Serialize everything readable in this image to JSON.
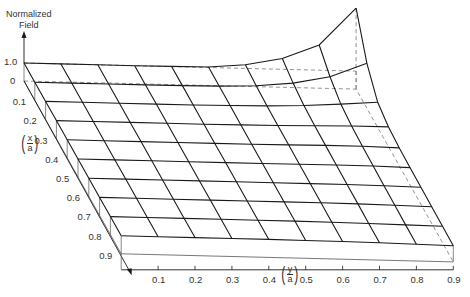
{
  "chart_data": {
    "type": "surface3d",
    "title": "",
    "zlabel": "Normalized Field",
    "xlabel": "(x/a)",
    "ylabel": "(y/a)",
    "z_ticks": [
      "1.0",
      "0"
    ],
    "x_ticks": [
      "0.1",
      "0.2",
      "0.3",
      "0.4",
      "0.5",
      "0.6",
      "0.7",
      "0.8",
      "0.9"
    ],
    "y_ticks": [
      "0.1",
      "0.2",
      "0.3",
      "0.4",
      "0.5",
      "0.6",
      "0.7",
      "0.8",
      "0.9"
    ],
    "x_grid": [
      0,
      0.1,
      0.2,
      0.3,
      0.4,
      0.5,
      0.6,
      0.7,
      0.8,
      0.9
    ],
    "y_grid": [
      0,
      0.1,
      0.2,
      0.3,
      0.4,
      0.5,
      0.6,
      0.7,
      0.8,
      0.9
    ],
    "z_values_note": "rows indexed by x (0..0.9), columns by y (0..0.9); normalized field ~1.0 except sharp rise toward edge y=0.9 near x=0",
    "z": [
      [
        1.0,
        1.0,
        1.0,
        1.0,
        1.01,
        1.03,
        1.2,
        1.6,
        2.4,
        4.5
      ],
      [
        1.0,
        1.0,
        1.0,
        1.0,
        1.01,
        1.03,
        1.1,
        1.3,
        1.7,
        2.5
      ],
      [
        1.0,
        1.0,
        1.0,
        1.0,
        1.0,
        1.02,
        1.05,
        1.12,
        1.25,
        1.4
      ],
      [
        1.0,
        1.0,
        1.0,
        1.0,
        1.0,
        1.01,
        1.03,
        1.06,
        1.1,
        1.1
      ],
      [
        1.0,
        1.0,
        1.0,
        1.0,
        1.0,
        1.0,
        1.02,
        1.04,
        1.04,
        1.0
      ],
      [
        1.0,
        1.0,
        1.0,
        1.0,
        1.0,
        1.0,
        1.01,
        1.02,
        1.01,
        0.97
      ],
      [
        1.0,
        1.0,
        1.0,
        1.0,
        1.0,
        1.0,
        1.0,
        1.0,
        0.98,
        0.95
      ],
      [
        1.0,
        1.0,
        1.0,
        1.0,
        1.0,
        1.0,
        1.0,
        0.99,
        0.96,
        0.93
      ],
      [
        1.0,
        1.0,
        1.0,
        1.0,
        1.0,
        1.0,
        0.99,
        0.97,
        0.94,
        0.91
      ],
      [
        1.0,
        1.0,
        1.0,
        1.0,
        1.0,
        0.99,
        0.98,
        0.96,
        0.93,
        0.9
      ]
    ],
    "projection": {
      "origin": [
        24,
        81
      ],
      "x_step": [
        10.8,
        19.2
      ],
      "y_step": [
        36.9,
        0.9
      ],
      "z_unit": 18
    },
    "line_color": "#1a1a1a",
    "dash_color": "#777777"
  }
}
